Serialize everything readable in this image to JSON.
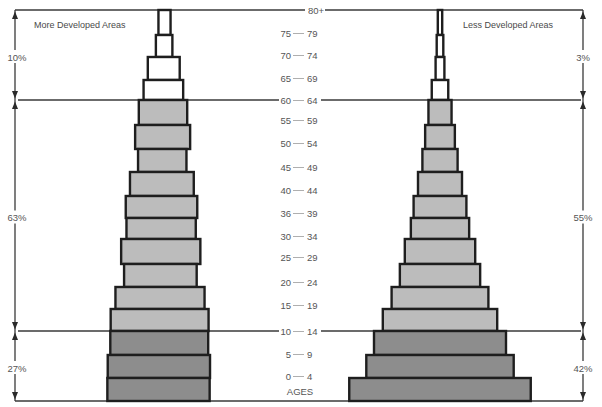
{
  "chart_data": {
    "type": "bar",
    "subtype": "population-pyramid",
    "title": "",
    "xlabel": "",
    "ylabel": "AGES",
    "categories": [
      "80+",
      "75-79",
      "70-74",
      "65-69",
      "60-64",
      "55-59",
      "50-54",
      "45-49",
      "40-44",
      "36-39",
      "30-34",
      "25-29",
      "20-24",
      "15-19",
      "10-14",
      "5-9",
      "0-4"
    ],
    "tick_labels": [
      {
        "from": "80+",
        "to": ""
      },
      {
        "from": "75",
        "to": "79"
      },
      {
        "from": "70",
        "to": "74"
      },
      {
        "from": "65",
        "to": "69"
      },
      {
        "from": "60",
        "to": "64"
      },
      {
        "from": "55",
        "to": "59"
      },
      {
        "from": "50",
        "to": "54"
      },
      {
        "from": "45",
        "to": "49"
      },
      {
        "from": "40",
        "to": "44"
      },
      {
        "from": "36",
        "to": "39"
      },
      {
        "from": "30",
        "to": "34"
      },
      {
        "from": "25",
        "to": "29"
      },
      {
        "from": "20",
        "to": "24"
      },
      {
        "from": "15",
        "to": "19"
      },
      {
        "from": "10",
        "to": "14"
      },
      {
        "from": "5",
        "to": "9"
      },
      {
        "from": "0",
        "to": "4"
      }
    ],
    "series": [
      {
        "name": "More Developed Areas",
        "values": [
          1.1,
          1.5,
          2.9,
          3.6,
          4.4,
          5.0,
          4.4,
          5.8,
          6.5,
          6.3,
          7.2,
          6.6,
          8.1,
          8.9,
          8.9,
          9.3,
          9.3
        ]
      },
      {
        "name": "Less Developed Areas",
        "values": [
          0.4,
          0.6,
          0.8,
          1.5,
          2.1,
          2.7,
          3.2,
          4.0,
          4.8,
          5.3,
          6.4,
          7.3,
          8.8,
          10.4,
          12.0,
          13.4,
          16.5
        ]
      }
    ],
    "groups": [
      {
        "categories": [
          "80+",
          "75-79",
          "70-74",
          "65-69"
        ],
        "share": {
          "more_developed": "10%",
          "less_developed": "3%"
        },
        "fill": "#ffffff"
      },
      {
        "categories": [
          "60-64",
          "55-59",
          "50-54",
          "45-49",
          "40-44",
          "36-39",
          "30-34",
          "25-29",
          "20-24",
          "15-19"
        ],
        "share": {
          "more_developed": "63%",
          "less_developed": "55%"
        },
        "fill": "#bcbcbc"
      },
      {
        "categories": [
          "10-14",
          "5-9",
          "0-4"
        ],
        "share": {
          "more_developed": "27%",
          "less_developed": "42%"
        },
        "fill": "#8d8d8d"
      }
    ],
    "outline_color": "#1e1e1e",
    "grid": false,
    "legend": "none"
  }
}
